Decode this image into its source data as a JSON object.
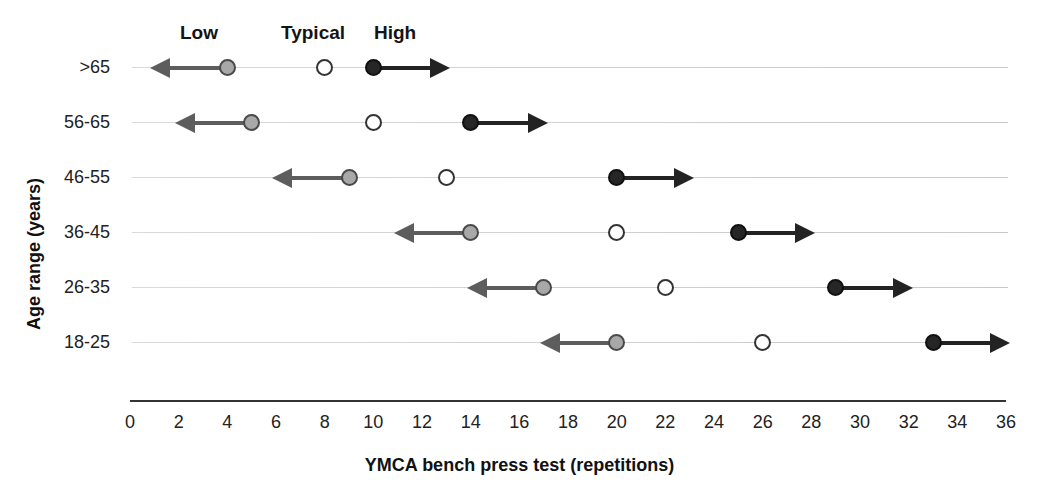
{
  "chart_data": {
    "type": "scatter",
    "title": "",
    "xlabel": "YMCA bench press test (repetitions)",
    "ylabel": "Age range (years)",
    "xlim": [
      0,
      36
    ],
    "xticks": [
      0,
      2,
      4,
      6,
      8,
      10,
      12,
      14,
      16,
      18,
      20,
      22,
      24,
      26,
      28,
      30,
      32,
      34,
      36
    ],
    "categories": [
      "18-25",
      "26-35",
      "36-45",
      "46-55",
      "56-65",
      ">65"
    ],
    "legend": {
      "position": "top",
      "entries": [
        {
          "name": "Low",
          "marker": "filled-gray-circle",
          "color": "#a8a8a8"
        },
        {
          "name": "Typical",
          "marker": "open-circle",
          "color": "#ffffff"
        },
        {
          "name": "High",
          "marker": "filled-black-circle",
          "color": "#262626"
        }
      ]
    },
    "grid": false,
    "series": [
      {
        "name": "Low",
        "values": [
          20,
          17,
          14,
          9,
          5,
          4
        ],
        "arrow_direction": "left"
      },
      {
        "name": "Typical",
        "values": [
          26,
          22,
          20,
          13,
          10,
          8
        ],
        "arrow_direction": "none"
      },
      {
        "name": "High",
        "values": [
          33,
          29,
          25,
          20,
          14,
          10
        ],
        "arrow_direction": "right"
      }
    ],
    "rows": [
      {
        "age": ">65",
        "low": 4,
        "typical": 8,
        "high": 10,
        "low_arrow_end": 1,
        "high_arrow_end": 13
      },
      {
        "age": "56-65",
        "low": 5,
        "typical": 10,
        "high": 14,
        "low_arrow_end": 2,
        "high_arrow_end": 17
      },
      {
        "age": "46-55",
        "low": 9,
        "typical": 13,
        "high": 20,
        "low_arrow_end": 6,
        "high_arrow_end": 23
      },
      {
        "age": "36-45",
        "low": 14,
        "typical": 20,
        "high": 25,
        "low_arrow_end": 11,
        "high_arrow_end": 28
      },
      {
        "age": "26-35",
        "low": 17,
        "typical": 22,
        "high": 29,
        "low_arrow_end": 14,
        "high_arrow_end": 32
      },
      {
        "age": "18-25",
        "low": 20,
        "typical": 26,
        "high": 33,
        "low_arrow_end": 17,
        "high_arrow_end": 36
      }
    ]
  },
  "axis": {
    "x_title": "YMCA bench press test (repetitions)",
    "y_title": "Age range (years)",
    "x_ticks": [
      "0",
      "2",
      "4",
      "6",
      "8",
      "10",
      "12",
      "14",
      "16",
      "18",
      "20",
      "22",
      "24",
      "26",
      "28",
      "30",
      "32",
      "34",
      "36"
    ],
    "y_ticks": [
      ">65",
      "56-65",
      "46-55",
      "36-45",
      "26-35",
      "18-25"
    ]
  },
  "legend": {
    "low": "Low",
    "typical": "Typical",
    "high": "High"
  }
}
